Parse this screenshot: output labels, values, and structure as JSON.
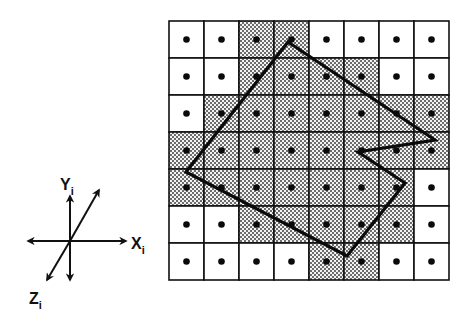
{
  "figure": {
    "grid": {
      "cols": 8,
      "rows": 7,
      "origin_x": 169,
      "origin_y": 21,
      "cell_w": 35,
      "cell_h": 37,
      "shaded": [
        [
          0,
          0,
          1,
          1,
          0,
          0,
          0,
          0
        ],
        [
          0,
          0,
          1,
          1,
          1,
          1,
          0,
          0
        ],
        [
          0,
          1,
          1,
          1,
          1,
          1,
          1,
          1
        ],
        [
          1,
          1,
          1,
          1,
          1,
          1,
          1,
          1
        ],
        [
          1,
          1,
          1,
          1,
          1,
          1,
          1,
          0
        ],
        [
          0,
          0,
          1,
          1,
          1,
          1,
          1,
          0
        ],
        [
          0,
          0,
          0,
          0,
          1,
          1,
          0,
          0
        ]
      ],
      "sample_point": "dot at each cell center",
      "line_color": "#111111",
      "shade_pattern": "dotted stipple"
    },
    "polygon": {
      "vertices": [
        [
          288,
          42
        ],
        [
          435,
          140
        ],
        [
          358,
          152
        ],
        [
          405,
          183
        ],
        [
          347,
          256
        ],
        [
          186,
          172
        ]
      ],
      "stroke_color": "#0a0a0a",
      "stroke_width": 3.2
    },
    "axes": {
      "center": [
        70,
        241
      ],
      "labels": {
        "x": {
          "main": "X",
          "sub": "i"
        },
        "y": {
          "main": "Y",
          "sub": "i"
        },
        "z": {
          "main": "Z",
          "sub": "i"
        }
      }
    }
  }
}
